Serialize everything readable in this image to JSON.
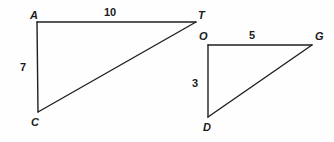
{
  "figure": {
    "type": "geometry-diagram",
    "background_color": "#fefefe",
    "stroke_color": "#1f1f1f",
    "text_color": "#1a1a1a",
    "stroke_width": 1.4,
    "triangles": [
      {
        "name": "triangle-ATC",
        "vertices": [
          {
            "label": "A",
            "x": 37,
            "y": 22
          },
          {
            "label": "T",
            "x": 196,
            "y": 22
          },
          {
            "label": "C",
            "x": 38,
            "y": 112
          }
        ],
        "side_lengths": [
          {
            "label": "10",
            "side": "AT"
          },
          {
            "label": "7",
            "side": "AC"
          }
        ]
      },
      {
        "name": "triangle-OGD",
        "vertices": [
          {
            "label": "O",
            "x": 208,
            "y": 45
          },
          {
            "label": "G",
            "x": 312,
            "y": 45
          },
          {
            "label": "D",
            "x": 208,
            "y": 117
          }
        ],
        "side_lengths": [
          {
            "label": "5",
            "side": "OG"
          },
          {
            "label": "3",
            "side": "OD"
          }
        ]
      }
    ],
    "labels": {
      "vertex_a": "A",
      "vertex_t": "T",
      "vertex_c": "C",
      "vertex_o": "O",
      "vertex_g": "G",
      "vertex_d": "D",
      "length_at": "10",
      "length_ac": "7",
      "length_og": "5",
      "length_od": "3"
    }
  }
}
